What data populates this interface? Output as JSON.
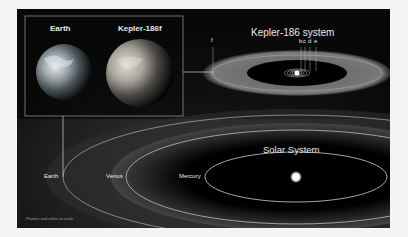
{
  "comparison_box": {
    "earth_label": "Earth",
    "kepler_label": "Kepler-186f"
  },
  "kepler_system": {
    "title": "Kepler-186  system",
    "planet_f": "f",
    "planets_inner": [
      "b",
      "c",
      "d",
      "e"
    ]
  },
  "solar_system": {
    "title": "Solar System",
    "earth": "Earth",
    "venus": "Venus",
    "mercury": "Mercury"
  },
  "footnote": "Planets and orbits to scale",
  "colors": {
    "background": "#000000",
    "habitable_zone": "#5a5a5a",
    "orbit_line": "#bdbdbd",
    "text": "#e8e8e8"
  }
}
